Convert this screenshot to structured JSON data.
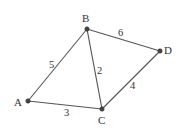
{
  "diagram": {
    "type": "weighted-undirected-graph",
    "nodes": [
      {
        "id": "A",
        "label": "A",
        "x": 28,
        "y": 101,
        "label_x": 14,
        "label_y": 106
      },
      {
        "id": "B",
        "label": "B",
        "x": 87,
        "y": 29,
        "label_x": 82,
        "label_y": 22
      },
      {
        "id": "C",
        "label": "C",
        "x": 102,
        "y": 109,
        "label_x": 98,
        "label_y": 124
      },
      {
        "id": "D",
        "label": "D",
        "x": 160,
        "y": 51,
        "label_x": 164,
        "label_y": 54
      }
    ],
    "edges": [
      {
        "from": "A",
        "to": "B",
        "weight": "5",
        "label_x": 49,
        "label_y": 68
      },
      {
        "from": "B",
        "to": "D",
        "weight": "6",
        "label_x": 118,
        "label_y": 36
      },
      {
        "from": "B",
        "to": "C",
        "weight": "2",
        "label_x": 97,
        "label_y": 74
      },
      {
        "from": "C",
        "to": "D",
        "weight": "4",
        "label_x": 130,
        "label_y": 89
      },
      {
        "from": "A",
        "to": "C",
        "weight": "3",
        "label_x": 64,
        "label_y": 116
      }
    ],
    "colors": {
      "edge": "#555555",
      "node": "#444444",
      "text": "#333333",
      "background": "#ffffff"
    }
  }
}
